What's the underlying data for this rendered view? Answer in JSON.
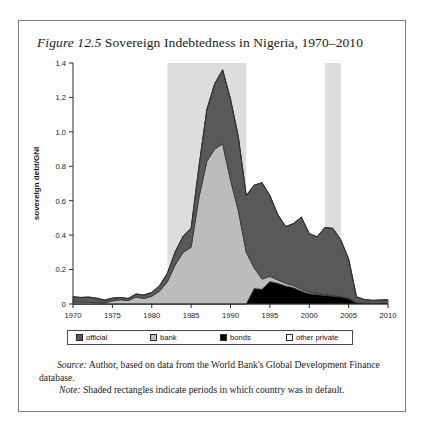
{
  "figure": {
    "label": "Figure 12.5",
    "title": "Sovereign Indebtedness in Nigeria, 1970–2010"
  },
  "legend": {
    "items": [
      {
        "label": "official",
        "color": "#595959",
        "x": 8
      },
      {
        "label": "bank",
        "color": "#bcbcbc",
        "x": 82
      },
      {
        "label": "bonds",
        "color": "#000000",
        "x": 152
      },
      {
        "label": "other private",
        "color": "#ffffff",
        "x": 218
      }
    ]
  },
  "notes": {
    "source_label": "Source:",
    "source_text": "Author, based on data from the World Bank's Global Development Finance database.",
    "note_label": "Note:",
    "note_text": "Shaded rectangles indicate periods in which country was in default."
  },
  "chart_data": {
    "type": "area",
    "stacked": true,
    "title": "Sovereign Indebtedness in Nigeria, 1970–2010",
    "xlabel": "",
    "ylabel": "sovereign debt/GNI",
    "xlim": [
      1970,
      2010
    ],
    "ylim": [
      0,
      1.4
    ],
    "xticks": [
      1970,
      1975,
      1980,
      1985,
      1990,
      1995,
      2000,
      2005,
      2010
    ],
    "yticks": [
      0,
      0.2,
      0.4,
      0.6,
      0.8,
      1.0,
      1.2,
      1.4
    ],
    "ytick_labels": [
      "0",
      "0.2",
      "0.4",
      "0.6",
      "0.8",
      "1.0",
      "1.2",
      "1.4"
    ],
    "grid": false,
    "legend_position": "below-axis",
    "x": [
      1970,
      1971,
      1972,
      1973,
      1974,
      1975,
      1976,
      1977,
      1978,
      1979,
      1980,
      1981,
      1982,
      1983,
      1984,
      1985,
      1986,
      1987,
      1988,
      1989,
      1990,
      1991,
      1992,
      1993,
      1994,
      1995,
      1996,
      1997,
      1998,
      1999,
      2000,
      2001,
      2002,
      2003,
      2004,
      2005,
      2006,
      2007,
      2008,
      2009,
      2010
    ],
    "series": [
      {
        "name": "official",
        "color": "#595959",
        "values": [
          0.03,
          0.028,
          0.03,
          0.026,
          0.017,
          0.016,
          0.014,
          0.012,
          0.018,
          0.02,
          0.022,
          0.032,
          0.05,
          0.075,
          0.095,
          0.11,
          0.18,
          0.3,
          0.38,
          0.43,
          0.47,
          0.43,
          0.33,
          0.48,
          0.56,
          0.47,
          0.38,
          0.33,
          0.36,
          0.42,
          0.34,
          0.33,
          0.39,
          0.39,
          0.33,
          0.23,
          0.035,
          0.022,
          0.018,
          0.02,
          0.022
        ]
      },
      {
        "name": "bank",
        "color": "#bcbcbc",
        "values": [
          0.012,
          0.01,
          0.01,
          0.008,
          0.006,
          0.018,
          0.024,
          0.02,
          0.04,
          0.032,
          0.045,
          0.075,
          0.13,
          0.23,
          0.3,
          0.33,
          0.62,
          0.83,
          0.9,
          0.93,
          0.72,
          0.54,
          0.3,
          0.12,
          0.06,
          0.03,
          0.02,
          0.015,
          0.012,
          0.01,
          0.008,
          0.006,
          0.005,
          0.004,
          0.003,
          0.002,
          0.001,
          0.0,
          0.0,
          0.0,
          0.0
        ]
      },
      {
        "name": "bonds",
        "color": "#000000",
        "values": [
          0.0,
          0.0,
          0.0,
          0.0,
          0.0,
          0.0,
          0.0,
          0.0,
          0.0,
          0.0,
          0.0,
          0.0,
          0.0,
          0.0,
          0.0,
          0.0,
          0.0,
          0.0,
          0.0,
          0.0,
          0.0,
          0.0,
          0.0,
          0.09,
          0.085,
          0.13,
          0.12,
          0.105,
          0.095,
          0.075,
          0.06,
          0.055,
          0.05,
          0.045,
          0.04,
          0.03,
          0.006,
          0.004,
          0.003,
          0.003,
          0.003
        ]
      },
      {
        "name": "other private",
        "color": "#ffffff",
        "values": [
          0.0,
          0.0,
          0.0,
          0.0,
          0.0,
          0.0,
          0.0,
          0.0,
          0.0,
          0.0,
          0.0,
          0.0,
          0.0,
          0.0,
          0.0,
          0.0,
          0.0,
          0.0,
          0.0,
          0.0,
          0.0,
          0.0,
          0.0,
          0.0,
          0.0,
          0.0,
          0.0,
          0.0,
          0.0,
          0.0,
          0.0,
          0.0,
          0.0,
          0.0,
          0.0,
          0.0,
          0.0,
          0.0,
          0.0,
          0.0,
          0.0
        ]
      }
    ],
    "shaded_bands": [
      {
        "start": 1982,
        "end": 1992,
        "color": "#dddddd",
        "meaning": "default period"
      },
      {
        "start": 2002,
        "end": 2004,
        "color": "#dddddd",
        "meaning": "default period"
      }
    ]
  }
}
